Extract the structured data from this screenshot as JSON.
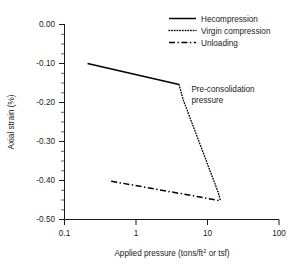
{
  "chart_data": {
    "type": "line",
    "title": "",
    "xlabel": "Applied pressure (tons/ft2 or tsf)",
    "xlabel_main": "Applied pressure (tons/ft",
    "xlabel_sup": "2",
    "xlabel_tail": " or tsf)",
    "ylabel": "Axial strain (%)",
    "xscale": "log",
    "yscale": "linear",
    "xlim": [
      0.1,
      100
    ],
    "ylim": [
      -0.5,
      0.0
    ],
    "grid": false,
    "legend_position": "top-right",
    "xticks": [
      "0.1",
      "1",
      "10",
      "100"
    ],
    "xtick_values": [
      0.1,
      1,
      10,
      100
    ],
    "yticks": [
      "0.00",
      "-0.10",
      "-0.20",
      "-0.30",
      "-0.40",
      "-0.50"
    ],
    "ytick_values": [
      0.0,
      -0.1,
      -0.2,
      -0.3,
      -0.4,
      -0.5
    ],
    "series": [
      {
        "name": "Hecompression",
        "style": "solid",
        "points": [
          {
            "x": 0.21,
            "y": -0.101
          },
          {
            "x": 4.0,
            "y": -0.155
          }
        ]
      },
      {
        "name": "Virgin compression",
        "style": "dotted",
        "points": [
          {
            "x": 4.0,
            "y": -0.155
          },
          {
            "x": 4.6,
            "y": -0.195
          },
          {
            "x": 14.2,
            "y": -0.432
          },
          {
            "x": 15.2,
            "y": -0.452
          }
        ]
      },
      {
        "name": "Unloading",
        "style": "dash-dot",
        "points": [
          {
            "x": 0.45,
            "y": -0.402
          },
          {
            "x": 15.2,
            "y": -0.452
          }
        ]
      }
    ],
    "annotations": [
      {
        "name": "pre-consolidation-pressure",
        "line1": "Pre-consolidation",
        "line2": "pressure",
        "x": 4.6,
        "y": -0.175
      }
    ]
  },
  "legend": {
    "items": [
      {
        "label": "Hecompression",
        "style": "solid"
      },
      {
        "label": "Virgin compression",
        "style": "dotted"
      },
      {
        "label": "Unloading",
        "style": "dash-dot"
      }
    ]
  }
}
